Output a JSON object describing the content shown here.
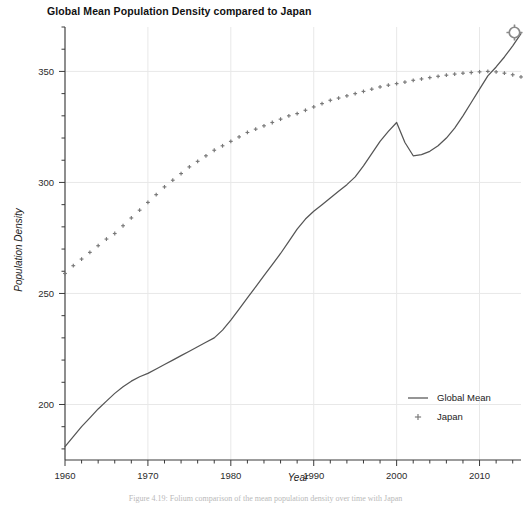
{
  "figure": {
    "title": "Global Mean Population Density compared to Japan",
    "caption": "Figure 4.19: Folium comparison of the mean population density over time with Japan",
    "gear_icon_name": "gear-icon"
  },
  "chart_data": {
    "type": "line",
    "title": "Global Mean Population Density compared to Japan",
    "xlabel": "Year",
    "ylabel": "Population Density",
    "xlim": [
      1960,
      2015
    ],
    "ylim": [
      175,
      370
    ],
    "grid": true,
    "legend_position": "bottom-right-inside",
    "x_major_ticks": [
      1960,
      1970,
      1980,
      1990,
      2000,
      2010
    ],
    "x_major_tick_labels": [
      "1960",
      "1970",
      "1980",
      "1990",
      "2000",
      "2010"
    ],
    "x_minor_tick_step": 2,
    "y_major_ticks": [
      200,
      250,
      300,
      350
    ],
    "y_major_tick_labels": [
      "200",
      "250",
      "300",
      "350"
    ],
    "y_minor_tick_step": 10,
    "x": [
      1960,
      1961,
      1962,
      1963,
      1964,
      1965,
      1966,
      1967,
      1968,
      1969,
      1970,
      1971,
      1972,
      1973,
      1974,
      1975,
      1976,
      1977,
      1978,
      1979,
      1980,
      1981,
      1982,
      1983,
      1984,
      1985,
      1986,
      1987,
      1988,
      1989,
      1990,
      1991,
      1992,
      1993,
      1994,
      1995,
      1996,
      1997,
      1998,
      1999,
      2000,
      2001,
      2002,
      2003,
      2004,
      2005,
      2006,
      2007,
      2008,
      2009,
      2010,
      2011,
      2012,
      2013,
      2014,
      2015
    ],
    "series": [
      {
        "name": "Global Mean",
        "style": "solid-line",
        "color": "#555555",
        "values": [
          181.0,
          185.5,
          190.0,
          194.0,
          198.0,
          201.5,
          205.0,
          208.0,
          210.5,
          212.5,
          214.0,
          216.0,
          218.0,
          220.0,
          222.0,
          224.0,
          226.0,
          228.0,
          230.0,
          233.5,
          238.0,
          243.0,
          248.0,
          253.0,
          258.0,
          263.0,
          268.0,
          273.5,
          279.0,
          283.5,
          287.0,
          290.0,
          293.0,
          296.0,
          299.0,
          302.5,
          307.5,
          313.0,
          318.5,
          323.0,
          327.0,
          318.0,
          312.0,
          312.5,
          314.0,
          316.5,
          320.0,
          324.5,
          330.0,
          336.0,
          342.0,
          348.0,
          352.0,
          356.5,
          361.5,
          367.0
        ]
      },
      {
        "name": "Japan",
        "style": "plus-markers",
        "color": "#777777",
        "values": [
          259.0,
          262.5,
          265.5,
          268.5,
          271.5,
          274.5,
          277.0,
          280.5,
          284.0,
          287.5,
          291.0,
          294.5,
          298.0,
          301.0,
          304.0,
          307.0,
          309.5,
          312.0,
          314.5,
          316.5,
          318.5,
          320.5,
          322.5,
          324.0,
          325.5,
          327.0,
          328.5,
          330.0,
          331.0,
          332.5,
          334.0,
          335.5,
          337.0,
          338.0,
          339.0,
          340.0,
          341.0,
          342.0,
          343.0,
          343.8,
          344.5,
          345.2,
          346.0,
          346.6,
          347.2,
          347.8,
          348.3,
          348.8,
          349.2,
          349.5,
          349.8,
          350.0,
          349.8,
          349.2,
          348.5,
          347.5
        ]
      }
    ]
  },
  "legend": {
    "entries": [
      {
        "label": "Global Mean",
        "marker": "line"
      },
      {
        "label": "Japan",
        "marker": "plus"
      }
    ]
  },
  "colors": {
    "line": "#555555",
    "marker": "#777777",
    "grid": "#e8e8e8",
    "axis": "#3a3a3a",
    "title": "#111111"
  }
}
